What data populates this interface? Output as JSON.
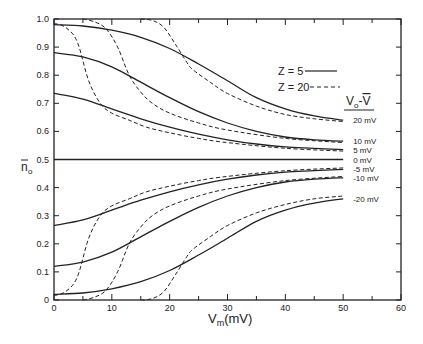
{
  "chart_data": {
    "type": "line",
    "title": "",
    "xlabel": "V_m(mV)",
    "ylabel": "n̄_0",
    "xlim": [
      0,
      60
    ],
    "ylim": [
      0,
      1.0
    ],
    "x_ticks": [
      0,
      10,
      20,
      30,
      40,
      50,
      60
    ],
    "x_tick_labels": [
      "0",
      "10",
      "20",
      "30",
      "40",
      "50",
      "60"
    ],
    "y_ticks": [
      0,
      0.1,
      0.2,
      0.3,
      0.4,
      0.5,
      0.6,
      0.7,
      0.8,
      0.9,
      1.0
    ],
    "y_tick_labels": [
      "0",
      "0.1",
      "0.2",
      "0.3",
      "0.4",
      "0.5",
      "0.6",
      "0.7",
      "0.8",
      "0.9",
      "1.0"
    ],
    "grid": false,
    "legend": {
      "position": "upper right",
      "entries": [
        {
          "label": "Z = 5",
          "style": "solid"
        },
        {
          "label": "Z = 20",
          "style": "dashed"
        }
      ]
    },
    "curve_label_header": "V_0 - V̄",
    "series": [
      {
        "name": "20 mV, Z=5",
        "style": "solid",
        "label": "20 mV",
        "x": [
          0,
          5,
          10,
          15,
          20,
          25,
          30,
          35,
          40,
          45,
          50
        ],
        "y": [
          0.98,
          0.975,
          0.96,
          0.935,
          0.895,
          0.84,
          0.78,
          0.72,
          0.68,
          0.655,
          0.64
        ]
      },
      {
        "name": "20 mV, Z=20",
        "style": "dashed",
        "x": [
          15,
          17,
          19,
          21,
          23,
          24,
          27,
          30,
          35,
          40,
          45,
          50
        ],
        "y": [
          1.0,
          0.995,
          0.97,
          0.91,
          0.845,
          0.82,
          0.775,
          0.735,
          0.69,
          0.66,
          0.645,
          0.635
        ]
      },
      {
        "name": "10 mV, Z=5",
        "style": "solid",
        "label": "10 mV",
        "x": [
          0,
          5,
          10,
          15,
          20,
          25,
          30,
          35,
          40,
          45,
          50
        ],
        "y": [
          0.88,
          0.865,
          0.83,
          0.775,
          0.72,
          0.67,
          0.63,
          0.6,
          0.58,
          0.57,
          0.565
        ]
      },
      {
        "name": "10 mV, Z=20",
        "style": "dashed",
        "x": [
          5,
          7,
          9,
          11,
          13,
          15,
          17,
          20,
          25,
          30,
          40,
          50
        ],
        "y": [
          1.0,
          0.99,
          0.965,
          0.9,
          0.8,
          0.74,
          0.7,
          0.665,
          0.63,
          0.605,
          0.575,
          0.56
        ]
      },
      {
        "name": "5 mV, Z=5",
        "style": "solid",
        "label": "5 mV",
        "x": [
          0,
          5,
          10,
          15,
          20,
          25,
          30,
          35,
          40,
          45,
          50
        ],
        "y": [
          0.735,
          0.715,
          0.68,
          0.645,
          0.615,
          0.59,
          0.57,
          0.555,
          0.545,
          0.54,
          0.535
        ]
      },
      {
        "name": "5 mV, Z=20",
        "style": "dashed",
        "x": [
          0,
          2,
          4,
          6,
          8,
          10,
          13,
          16,
          20,
          25,
          30,
          40,
          50
        ],
        "y": [
          0.985,
          0.97,
          0.92,
          0.78,
          0.7,
          0.665,
          0.64,
          0.615,
          0.595,
          0.575,
          0.56,
          0.54,
          0.53
        ]
      },
      {
        "name": "0 mV",
        "style": "solid",
        "label": "0 mV",
        "x": [
          0,
          50
        ],
        "y": [
          0.5,
          0.5
        ]
      },
      {
        "name": "-5 mV, Z=5",
        "style": "solid",
        "label": "-5 mV",
        "x": [
          0,
          5,
          10,
          15,
          20,
          25,
          30,
          35,
          40,
          45,
          50
        ],
        "y": [
          0.265,
          0.285,
          0.32,
          0.355,
          0.385,
          0.41,
          0.43,
          0.445,
          0.455,
          0.46,
          0.465
        ]
      },
      {
        "name": "-5 mV, Z=20",
        "style": "dashed",
        "x": [
          0,
          2,
          4,
          6,
          8,
          10,
          13,
          16,
          20,
          25,
          30,
          40,
          50
        ],
        "y": [
          0.015,
          0.03,
          0.08,
          0.22,
          0.3,
          0.335,
          0.36,
          0.385,
          0.405,
          0.425,
          0.44,
          0.46,
          0.47
        ]
      },
      {
        "name": "-10 mV, Z=5",
        "style": "solid",
        "label": "-10 mV",
        "x": [
          0,
          5,
          10,
          15,
          20,
          25,
          30,
          35,
          40,
          45,
          50
        ],
        "y": [
          0.12,
          0.135,
          0.17,
          0.225,
          0.28,
          0.33,
          0.37,
          0.4,
          0.42,
          0.43,
          0.435
        ]
      },
      {
        "name": "-10 mV, Z=20",
        "style": "dashed",
        "x": [
          5,
          7,
          9,
          11,
          13,
          15,
          17,
          20,
          25,
          30,
          40,
          50
        ],
        "y": [
          0.0,
          0.01,
          0.035,
          0.1,
          0.2,
          0.26,
          0.3,
          0.335,
          0.37,
          0.395,
          0.425,
          0.44
        ]
      },
      {
        "name": "-20 mV, Z=5",
        "style": "solid",
        "label": "-20 mV",
        "x": [
          0,
          5,
          10,
          15,
          20,
          25,
          30,
          35,
          40,
          45,
          50
        ],
        "y": [
          0.02,
          0.025,
          0.04,
          0.065,
          0.105,
          0.16,
          0.22,
          0.28,
          0.32,
          0.345,
          0.36
        ]
      },
      {
        "name": "-20 mV, Z=20",
        "style": "dashed",
        "x": [
          15,
          17,
          19,
          21,
          23,
          24,
          27,
          30,
          35,
          40,
          45,
          50
        ],
        "y": [
          0.0,
          0.005,
          0.03,
          0.09,
          0.155,
          0.18,
          0.225,
          0.265,
          0.31,
          0.34,
          0.36,
          0.37
        ]
      }
    ]
  }
}
